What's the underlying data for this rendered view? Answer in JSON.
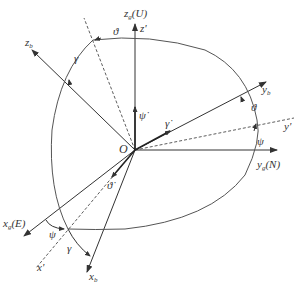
{
  "diagram": {
    "origin": {
      "label": "O"
    },
    "axes": {
      "zg": {
        "base": "z",
        "sub": "g",
        "suffix": "(U)"
      },
      "yg": {
        "base": "y",
        "sub": "g",
        "suffix": "(N)"
      },
      "xg": {
        "base": "x",
        "sub": "g",
        "suffix": "(E)"
      },
      "zb": {
        "base": "z",
        "sub": "b"
      },
      "yb": {
        "base": "y",
        "sub": "b"
      },
      "xb": {
        "base": "x",
        "sub": "b"
      },
      "zp": {
        "label": "z'"
      },
      "yp": {
        "label": "y'"
      },
      "xp": {
        "label": "x'"
      }
    },
    "angles": {
      "theta_top": "ϑ",
      "theta_right": "ϑ",
      "gamma_top": "γ",
      "gamma_bottom": "γ",
      "psi_right": "ψ",
      "psi_bottom": "ψ"
    },
    "rates": {
      "psi_dot": "ψ̇",
      "gamma_dot": "γ̇",
      "theta_dot": "ϑ̇"
    },
    "colors": {
      "line": "#333333",
      "arc": "#555555",
      "background": "#ffffff"
    }
  }
}
